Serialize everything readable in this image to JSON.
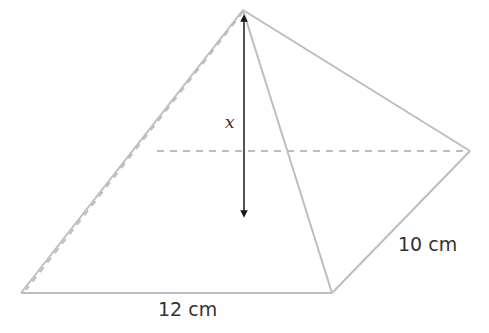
{
  "diagram": {
    "labels": {
      "height": "x",
      "base_length": "12 cm",
      "base_width": "10 cm"
    },
    "colors": {
      "edge": "#bdbdbd",
      "arrow": "#1a1a1a",
      "text": "#333333"
    }
  }
}
